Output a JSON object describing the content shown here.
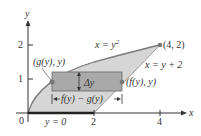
{
  "diagram": {
    "axes": {
      "x_label": "x",
      "y_label": "y",
      "origin_label": "0",
      "x_ticks": [
        "2",
        "4"
      ],
      "y_ticks": [
        "1",
        "2"
      ]
    },
    "curves": {
      "parabola_label": "x = y",
      "parabola_exponent": "2",
      "line_label": "x = y + 2"
    },
    "points": {
      "corner": "(4, 2)",
      "left_point": "(g(y), y)",
      "right_point": "(f(y), y)"
    },
    "strip": {
      "height_label": "Δy",
      "width_label": "f(y) − g(y)"
    },
    "base_label": "y = 0",
    "colors": {
      "region_fill": "#d6d6d6",
      "strip_fill": "#a9a9a9",
      "curve": "#7a7a7a",
      "axis": "#333333"
    }
  }
}
